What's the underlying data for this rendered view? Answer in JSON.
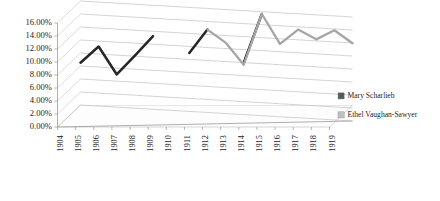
{
  "chart_data": {
    "type": "line",
    "title": "",
    "xlabel": "",
    "ylabel": "",
    "ylim": [
      0,
      0.16
    ],
    "ytick_labels": [
      "0.00%",
      "2.00%",
      "4.00%",
      "6.00%",
      "8.00%",
      "10.00%",
      "12.00%",
      "14.00%",
      "16.00%"
    ],
    "ytick_values": [
      0,
      2,
      4,
      6,
      8,
      10,
      12,
      14,
      16
    ],
    "grid": true,
    "legend_position": "right",
    "three_d": true,
    "categories": [
      "1904",
      "1905",
      "1906",
      "1907",
      "1908",
      "1909",
      "1910",
      "1911",
      "1912",
      "1913",
      "1914",
      "1915",
      "1916",
      "1917",
      "1918",
      "1919"
    ],
    "series": [
      {
        "name": "Mary Scharlieb",
        "color": "#262626",
        "values": [
          6.5,
          9.0,
          4.7,
          7.6,
          10.6,
          null,
          8.0,
          11.6,
          null,
          6.5,
          14.0,
          null,
          null,
          null,
          null,
          null
        ]
      },
      {
        "name": "Ethel Vaughan-Sawyer",
        "color": "#a6a6a6",
        "values": [
          null,
          null,
          null,
          null,
          null,
          null,
          null,
          11.6,
          9.6,
          6.2,
          14.0,
          9.4,
          11.6,
          10.1,
          11.5,
          9.5
        ]
      }
    ]
  },
  "legend": {
    "items": [
      {
        "label": "Mary Scharlieb",
        "color": "#595959"
      },
      {
        "label": "Ethel Vaughan-Sawyer",
        "color": "#bfbfbf"
      }
    ]
  },
  "axis": {
    "y_labels": [
      "16.00%",
      "14.00%",
      "12.00%",
      "10.00%",
      "8.00%",
      "6.00%",
      "4.00%",
      "2.00%",
      "0.00%"
    ],
    "x_labels": [
      "1904",
      "1905",
      "1906",
      "1907",
      "1908",
      "1909",
      "1910",
      "1911",
      "1912",
      "1913",
      "1914",
      "1915",
      "1916",
      "1917",
      "1918",
      "1919"
    ]
  }
}
